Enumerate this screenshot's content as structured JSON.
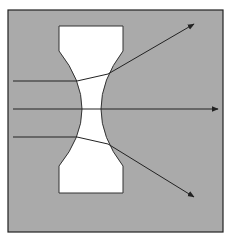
{
  "diagram": {
    "colors": {
      "background": "#aaaaaa",
      "frame": "#222222",
      "lens_fill": "#ffffff",
      "ray": "#222222",
      "page": "#ffffff"
    },
    "frame": {
      "x": 8,
      "y": 10,
      "width": 215,
      "height": 222
    },
    "lens": {
      "type": "biconcave",
      "top_flat_y": 26,
      "bottom_flat_y": 193,
      "left_x": 59,
      "right_x": 123,
      "shoulder_top_y": 51,
      "shoulder_bottom_y": 166,
      "waist_left_x": 82,
      "waist_right_x": 101,
      "waist_y": 109
    },
    "rays": [
      {
        "name": "upper-ray",
        "points": [
          [
            13,
            81
          ],
          [
            77,
            81
          ],
          [
            108,
            74
          ],
          [
            194,
            24
          ]
        ],
        "arrow": true
      },
      {
        "name": "center-ray",
        "points": [
          [
            13,
            109
          ],
          [
            218,
            109
          ]
        ],
        "arrow": true
      },
      {
        "name": "lower-ray",
        "points": [
          [
            13,
            137
          ],
          [
            77,
            137
          ],
          [
            108,
            144
          ],
          [
            194,
            197
          ]
        ],
        "arrow": true
      }
    ]
  }
}
